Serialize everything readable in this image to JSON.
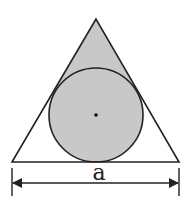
{
  "diagram": {
    "dimension_label": "a",
    "colors": {
      "stroke": "#222222",
      "shade": "#c8c8c8",
      "background": "#ffffff"
    }
  }
}
